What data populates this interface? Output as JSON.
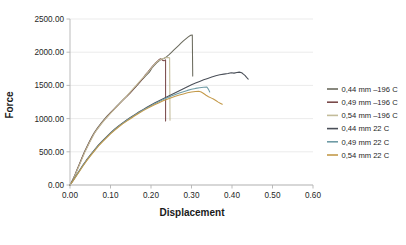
{
  "chart_data": {
    "type": "line",
    "title": "",
    "xlabel": "Displacement",
    "ylabel": "Force",
    "xlim": [
      0.0,
      0.6
    ],
    "ylim": [
      0.0,
      2500.0
    ],
    "xticks": [
      "0.00",
      "0.10",
      "0.20",
      "0.30",
      "0.40",
      "0.50",
      "0.60"
    ],
    "yticks": [
      "0.00",
      "500.00",
      "1000.00",
      "1500.00",
      "2000.00",
      "2500.00"
    ],
    "xtick_values": [
      0.0,
      0.1,
      0.2,
      0.3,
      0.4,
      0.5,
      0.6
    ],
    "ytick_values": [
      0,
      500,
      1000,
      1500,
      2000,
      2500
    ],
    "grid": "horizontal",
    "legend_position": "right",
    "series": [
      {
        "name": "0,44 mm –196 C",
        "color": "#6b6b5e",
        "points": [
          [
            0.0,
            0
          ],
          [
            0.006,
            70
          ],
          [
            0.012,
            150
          ],
          [
            0.018,
            240
          ],
          [
            0.024,
            330
          ],
          [
            0.03,
            420
          ],
          [
            0.036,
            505
          ],
          [
            0.042,
            580
          ],
          [
            0.048,
            655
          ],
          [
            0.054,
            725
          ],
          [
            0.06,
            790
          ],
          [
            0.068,
            860
          ],
          [
            0.076,
            925
          ],
          [
            0.084,
            985
          ],
          [
            0.092,
            1040
          ],
          [
            0.1,
            1090
          ],
          [
            0.108,
            1140
          ],
          [
            0.116,
            1190
          ],
          [
            0.124,
            1240
          ],
          [
            0.132,
            1290
          ],
          [
            0.14,
            1335
          ],
          [
            0.148,
            1385
          ],
          [
            0.156,
            1435
          ],
          [
            0.164,
            1490
          ],
          [
            0.172,
            1545
          ],
          [
            0.18,
            1600
          ],
          [
            0.188,
            1650
          ],
          [
            0.196,
            1700
          ],
          [
            0.202,
            1760
          ],
          [
            0.208,
            1800
          ],
          [
            0.214,
            1840
          ],
          [
            0.22,
            1870
          ],
          [
            0.226,
            1895
          ],
          [
            0.232,
            1905
          ],
          [
            0.238,
            1930
          ],
          [
            0.244,
            1960
          ],
          [
            0.25,
            1995
          ],
          [
            0.256,
            2030
          ],
          [
            0.262,
            2065
          ],
          [
            0.268,
            2100
          ],
          [
            0.274,
            2135
          ],
          [
            0.28,
            2170
          ],
          [
            0.286,
            2200
          ],
          [
            0.292,
            2230
          ],
          [
            0.298,
            2255
          ],
          [
            0.302,
            2260
          ],
          [
            0.303,
            1640
          ]
        ]
      },
      {
        "name": "0,49 mm –196 C",
        "color": "#7a4a4a",
        "points": [
          [
            0.0,
            0
          ],
          [
            0.006,
            65
          ],
          [
            0.012,
            145
          ],
          [
            0.018,
            235
          ],
          [
            0.024,
            320
          ],
          [
            0.03,
            410
          ],
          [
            0.036,
            495
          ],
          [
            0.042,
            570
          ],
          [
            0.048,
            645
          ],
          [
            0.054,
            715
          ],
          [
            0.06,
            780
          ],
          [
            0.068,
            850
          ],
          [
            0.076,
            915
          ],
          [
            0.084,
            975
          ],
          [
            0.092,
            1030
          ],
          [
            0.1,
            1085
          ],
          [
            0.108,
            1135
          ],
          [
            0.116,
            1185
          ],
          [
            0.124,
            1235
          ],
          [
            0.132,
            1285
          ],
          [
            0.14,
            1335
          ],
          [
            0.148,
            1385
          ],
          [
            0.156,
            1440
          ],
          [
            0.164,
            1495
          ],
          [
            0.172,
            1550
          ],
          [
            0.18,
            1605
          ],
          [
            0.186,
            1660
          ],
          [
            0.192,
            1700
          ],
          [
            0.198,
            1745
          ],
          [
            0.204,
            1790
          ],
          [
            0.21,
            1830
          ],
          [
            0.216,
            1865
          ],
          [
            0.22,
            1890
          ],
          [
            0.224,
            1900
          ],
          [
            0.228,
            1880
          ],
          [
            0.232,
            1870
          ],
          [
            0.234,
            1875
          ],
          [
            0.236,
            1885
          ],
          [
            0.236,
            965
          ]
        ]
      },
      {
        "name": "0,54 mm –196 C",
        "color": "#c3bc9a",
        "points": [
          [
            0.0,
            0
          ],
          [
            0.006,
            60
          ],
          [
            0.012,
            140
          ],
          [
            0.018,
            225
          ],
          [
            0.024,
            315
          ],
          [
            0.03,
            400
          ],
          [
            0.036,
            485
          ],
          [
            0.042,
            560
          ],
          [
            0.048,
            635
          ],
          [
            0.054,
            705
          ],
          [
            0.06,
            775
          ],
          [
            0.068,
            845
          ],
          [
            0.076,
            910
          ],
          [
            0.084,
            970
          ],
          [
            0.092,
            1025
          ],
          [
            0.1,
            1080
          ],
          [
            0.108,
            1130
          ],
          [
            0.116,
            1185
          ],
          [
            0.124,
            1235
          ],
          [
            0.132,
            1290
          ],
          [
            0.14,
            1340
          ],
          [
            0.148,
            1395
          ],
          [
            0.156,
            1450
          ],
          [
            0.164,
            1505
          ],
          [
            0.172,
            1560
          ],
          [
            0.18,
            1615
          ],
          [
            0.188,
            1665
          ],
          [
            0.194,
            1710
          ],
          [
            0.2,
            1755
          ],
          [
            0.206,
            1800
          ],
          [
            0.212,
            1840
          ],
          [
            0.218,
            1870
          ],
          [
            0.224,
            1890
          ],
          [
            0.23,
            1905
          ],
          [
            0.236,
            1915
          ],
          [
            0.242,
            1920
          ],
          [
            0.246,
            1915
          ],
          [
            0.247,
            975
          ]
        ]
      },
      {
        "name": "0,44 mm 22 C",
        "color": "#4a4f58",
        "points": [
          [
            0.0,
            0
          ],
          [
            0.008,
            75
          ],
          [
            0.016,
            150
          ],
          [
            0.024,
            225
          ],
          [
            0.032,
            300
          ],
          [
            0.04,
            370
          ],
          [
            0.05,
            450
          ],
          [
            0.06,
            525
          ],
          [
            0.07,
            600
          ],
          [
            0.08,
            665
          ],
          [
            0.09,
            725
          ],
          [
            0.1,
            785
          ],
          [
            0.11,
            840
          ],
          [
            0.12,
            890
          ],
          [
            0.13,
            935
          ],
          [
            0.14,
            980
          ],
          [
            0.15,
            1020
          ],
          [
            0.16,
            1060
          ],
          [
            0.17,
            1100
          ],
          [
            0.18,
            1135
          ],
          [
            0.19,
            1170
          ],
          [
            0.2,
            1205
          ],
          [
            0.21,
            1240
          ],
          [
            0.22,
            1270
          ],
          [
            0.23,
            1300
          ],
          [
            0.24,
            1330
          ],
          [
            0.25,
            1360
          ],
          [
            0.26,
            1390
          ],
          [
            0.27,
            1420
          ],
          [
            0.28,
            1450
          ],
          [
            0.29,
            1480
          ],
          [
            0.3,
            1510
          ],
          [
            0.31,
            1535
          ],
          [
            0.32,
            1560
          ],
          [
            0.33,
            1585
          ],
          [
            0.34,
            1605
          ],
          [
            0.35,
            1625
          ],
          [
            0.36,
            1645
          ],
          [
            0.37,
            1660
          ],
          [
            0.38,
            1670
          ],
          [
            0.39,
            1680
          ],
          [
            0.398,
            1690
          ],
          [
            0.405,
            1685
          ],
          [
            0.412,
            1695
          ],
          [
            0.418,
            1700
          ],
          [
            0.424,
            1690
          ],
          [
            0.428,
            1670
          ],
          [
            0.432,
            1650
          ],
          [
            0.436,
            1620
          ],
          [
            0.44,
            1595
          ]
        ]
      },
      {
        "name": "0,49 mm 22 C",
        "color": "#6e9ba5",
        "points": [
          [
            0.0,
            0
          ],
          [
            0.008,
            70
          ],
          [
            0.016,
            145
          ],
          [
            0.024,
            218
          ],
          [
            0.032,
            292
          ],
          [
            0.04,
            362
          ],
          [
            0.05,
            442
          ],
          [
            0.06,
            518
          ],
          [
            0.07,
            592
          ],
          [
            0.08,
            658
          ],
          [
            0.09,
            718
          ],
          [
            0.1,
            778
          ],
          [
            0.11,
            832
          ],
          [
            0.12,
            882
          ],
          [
            0.13,
            928
          ],
          [
            0.14,
            972
          ],
          [
            0.15,
            1012
          ],
          [
            0.16,
            1052
          ],
          [
            0.17,
            1092
          ],
          [
            0.18,
            1128
          ],
          [
            0.19,
            1162
          ],
          [
            0.2,
            1196
          ],
          [
            0.21,
            1228
          ],
          [
            0.22,
            1258
          ],
          [
            0.23,
            1288
          ],
          [
            0.24,
            1315
          ],
          [
            0.25,
            1340
          ],
          [
            0.26,
            1362
          ],
          [
            0.27,
            1385
          ],
          [
            0.28,
            1405
          ],
          [
            0.29,
            1425
          ],
          [
            0.3,
            1442
          ],
          [
            0.31,
            1455
          ],
          [
            0.32,
            1465
          ],
          [
            0.33,
            1472
          ],
          [
            0.338,
            1475
          ],
          [
            0.342,
            1440
          ],
          [
            0.345,
            1400
          ]
        ]
      },
      {
        "name": "0,54 mm 22 C",
        "color": "#c49a4a",
        "points": [
          [
            0.0,
            0
          ],
          [
            0.008,
            66
          ],
          [
            0.016,
            140
          ],
          [
            0.024,
            212
          ],
          [
            0.032,
            285
          ],
          [
            0.04,
            355
          ],
          [
            0.05,
            435
          ],
          [
            0.06,
            510
          ],
          [
            0.07,
            584
          ],
          [
            0.08,
            650
          ],
          [
            0.09,
            710
          ],
          [
            0.1,
            770
          ],
          [
            0.11,
            824
          ],
          [
            0.12,
            874
          ],
          [
            0.13,
            920
          ],
          [
            0.14,
            962
          ],
          [
            0.15,
            1002
          ],
          [
            0.16,
            1042
          ],
          [
            0.17,
            1080
          ],
          [
            0.18,
            1116
          ],
          [
            0.19,
            1150
          ],
          [
            0.2,
            1182
          ],
          [
            0.21,
            1212
          ],
          [
            0.22,
            1240
          ],
          [
            0.23,
            1268
          ],
          [
            0.24,
            1292
          ],
          [
            0.25,
            1315
          ],
          [
            0.26,
            1335
          ],
          [
            0.27,
            1355
          ],
          [
            0.28,
            1372
          ],
          [
            0.29,
            1388
          ],
          [
            0.3,
            1400
          ],
          [
            0.31,
            1408
          ],
          [
            0.318,
            1412
          ],
          [
            0.324,
            1400
          ],
          [
            0.33,
            1378
          ],
          [
            0.336,
            1352
          ],
          [
            0.342,
            1330
          ],
          [
            0.348,
            1312
          ],
          [
            0.354,
            1295
          ],
          [
            0.36,
            1272
          ],
          [
            0.366,
            1248
          ],
          [
            0.372,
            1228
          ],
          [
            0.376,
            1215
          ]
        ]
      }
    ]
  },
  "legend": {
    "items": [
      {
        "label": "0,44 mm –196 C",
        "color": "#6b6b5e"
      },
      {
        "label": "0,49 mm –196 C",
        "color": "#7a4a4a"
      },
      {
        "label": "0,54 mm –196 C",
        "color": "#c3bc9a"
      },
      {
        "label": "0,44 mm 22 C",
        "color": "#4a4f58"
      },
      {
        "label": "0,49 mm 22 C",
        "color": "#6e9ba5"
      },
      {
        "label": "0,54 mm 22 C",
        "color": "#c49a4a"
      }
    ]
  }
}
